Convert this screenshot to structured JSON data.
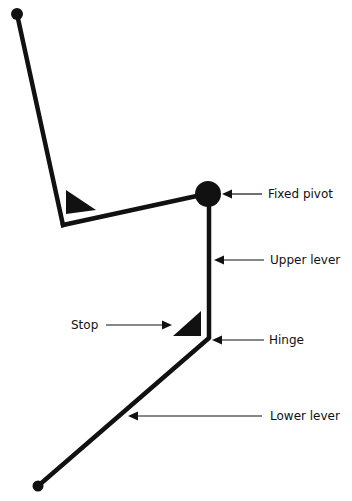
{
  "diagram": {
    "type": "mechanical linkage",
    "labels": {
      "fixed_pivot": "Fixed pivot",
      "upper_lever": "Upper lever",
      "stop": "Stop",
      "hinge": "Hinge",
      "lower_lever": "Lower lever"
    },
    "colors": {
      "line": "#111111",
      "background": "#ffffff"
    }
  }
}
